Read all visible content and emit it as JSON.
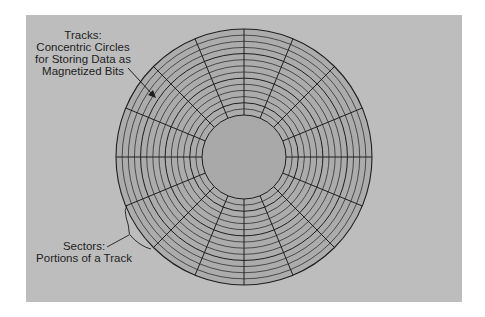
{
  "diagram": {
    "colors": {
      "background": "#ffffff",
      "panel": "#bdbdbd",
      "disc": "#acacac",
      "hub": "#a9a9a9",
      "lines": "#1e1e1e"
    },
    "disc": {
      "center": [
        244,
        157
      ],
      "outer_radius": 128,
      "hub_radius": 42,
      "track_count": 14,
      "sector_count": 16
    },
    "labels": {
      "tracks": {
        "lines": [
          "Tracks:",
          "Concentric Circles",
          "for Storing Data as",
          "Magnetized Bits"
        ]
      },
      "sectors": {
        "lines": [
          "Sectors:",
          "Portions of a Track"
        ]
      }
    }
  }
}
